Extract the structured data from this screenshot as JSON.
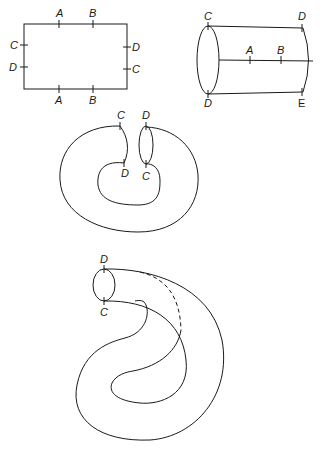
{
  "figures": [
    {
      "id": "square",
      "labels": {
        "top_a": "A",
        "top_b": "B",
        "bottom_a": "A",
        "bottom_b": "B",
        "left_c": "C",
        "left_d": "D",
        "right_d": "D",
        "right_c": "C"
      }
    },
    {
      "id": "cylinder",
      "labels": {
        "top_left": "C",
        "top_right": "D",
        "bottom_left": "D",
        "bottom_right": "E",
        "mid_a": "A",
        "mid_b": "B"
      }
    },
    {
      "id": "bent-tube",
      "labels": {
        "left_top": "C",
        "left_bottom": "D",
        "right_top": "D",
        "right_bottom": "C"
      }
    },
    {
      "id": "klein-bottle",
      "labels": {
        "top": "D",
        "bottom": "C"
      }
    }
  ]
}
